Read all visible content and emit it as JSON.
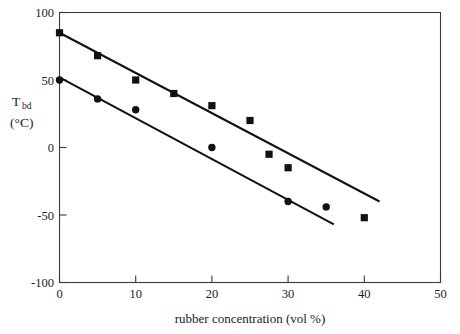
{
  "chart_data": {
    "type": "scatter",
    "title": "",
    "xlabel": "rubber concentration (vol %)",
    "ylabel_main": "T",
    "ylabel_sub": "bd",
    "ylabel_units": "(°C)",
    "xlim": [
      0,
      50
    ],
    "ylim": [
      -100,
      100
    ],
    "grid": false,
    "legend": "none",
    "xticks": [
      0,
      10,
      20,
      30,
      40,
      50
    ],
    "xtick_labels": [
      "0",
      "10",
      "20",
      "30",
      "40",
      "50"
    ],
    "yticks": [
      -100,
      -50,
      0,
      50,
      100
    ],
    "ytick_labels": [
      "-100",
      "-50",
      "0",
      "50",
      "100"
    ],
    "series": [
      {
        "name": "upper-series",
        "marker": "square",
        "x": [
          0,
          5,
          10,
          15,
          20,
          25,
          27.5,
          30,
          40
        ],
        "y": [
          85,
          68,
          50,
          40,
          31,
          20,
          -5,
          -15,
          -52
        ],
        "trendline": {
          "x0": 0,
          "y0": 85,
          "x1": 42,
          "y1": -40
        }
      },
      {
        "name": "lower-series",
        "marker": "circle",
        "x": [
          0,
          5,
          10,
          20,
          30,
          35
        ],
        "y": [
          50,
          36,
          28,
          0,
          -40,
          -44
        ],
        "trendline": {
          "x0": 0,
          "y0": 52,
          "x1": 36,
          "y1": -57
        }
      }
    ]
  },
  "axis_color": "#3a3a3a",
  "data_color": "#111111"
}
